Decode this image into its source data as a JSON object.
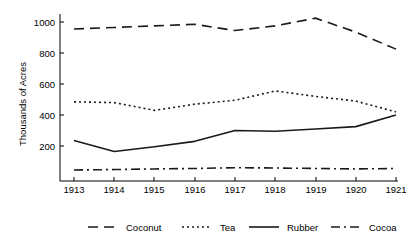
{
  "chart_data": {
    "type": "line",
    "title": "",
    "subtitle": "",
    "xlabel": "",
    "ylabel": "Thousands of Acres",
    "x": [
      1913,
      1914,
      1915,
      1916,
      1917,
      1918,
      1919,
      1920,
      1921
    ],
    "categories": [
      "1913",
      "1914",
      "1915",
      "1916",
      "1917",
      "1918",
      "1919",
      "1920",
      "1921"
    ],
    "xlim": [
      1913,
      1921
    ],
    "ylim": [
      0,
      1060
    ],
    "yticks": [
      200,
      400,
      600,
      800,
      1000
    ],
    "ytick_labels": [
      "200",
      "400",
      "600",
      "800",
      "1000"
    ],
    "xticks": [
      1913,
      1914,
      1915,
      1916,
      1917,
      1918,
      1919,
      1920,
      1921
    ],
    "grid": false,
    "legend_position": "bottom",
    "series": [
      {
        "name": "Coconut",
        "style": "dashed",
        "dash": "10,6",
        "color": "#1a1a1a",
        "values": [
          955,
          965,
          975,
          985,
          945,
          975,
          1025,
          935,
          825
        ]
      },
      {
        "name": "Tea",
        "style": "dotted",
        "dash": "2,3",
        "color": "#1a1a1a",
        "values": [
          485,
          480,
          430,
          470,
          495,
          555,
          520,
          490,
          420
        ]
      },
      {
        "name": "Rubber",
        "style": "solid",
        "dash": "none",
        "color": "#1a1a1a",
        "values": [
          235,
          165,
          195,
          230,
          300,
          295,
          310,
          325,
          400
        ]
      },
      {
        "name": "Cocoa",
        "style": "dashdot",
        "dash": "9,4,2,4",
        "color": "#1a1a1a",
        "values": [
          45,
          48,
          52,
          55,
          60,
          58,
          55,
          52,
          55
        ]
      }
    ]
  },
  "legend": {
    "items": [
      {
        "label": "Coconut",
        "dash": "10,6"
      },
      {
        "label": "Tea",
        "dash": "2,3"
      },
      {
        "label": "Rubber",
        "dash": "none"
      },
      {
        "label": "Cocoa",
        "dash": "9,4,2,4"
      }
    ]
  },
  "axes": {
    "y_title": "Thousands of Acres",
    "y_tick_labels": [
      "1000",
      "800",
      "600",
      "400",
      "200"
    ],
    "x_tick_labels": [
      "1913",
      "1914",
      "1915",
      "1916",
      "1917",
      "1918",
      "1919",
      "1920",
      "1921"
    ]
  }
}
